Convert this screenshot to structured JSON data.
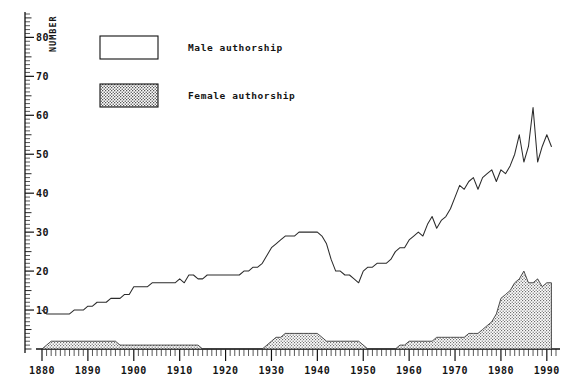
{
  "figure": {
    "caption": "The relative proportions of male and female authorship in the scientific literature",
    "y_axis_label": "NUMBER"
  },
  "legend": {
    "position": "top-left-inset",
    "items": [
      {
        "label": "Male authorship",
        "swatch": "white-box",
        "color": "#ffffff"
      },
      {
        "label": "Female authorship",
        "swatch": "dotted-box",
        "color": "#d9d9d9"
      }
    ]
  },
  "chart_data": {
    "type": "area",
    "title": "",
    "subtitle": "",
    "xlabel": "",
    "ylabel": "NUMBER",
    "xlim": [
      1880,
      1992
    ],
    "ylim": [
      0,
      86
    ],
    "grid": false,
    "x_ticks": [
      1880,
      1890,
      1900,
      1910,
      1920,
      1930,
      1940,
      1950,
      1960,
      1970,
      1980,
      1990
    ],
    "x_tick_labels": [
      "1880",
      "1890",
      "1900",
      "1910",
      "1920",
      "1930",
      "1940",
      "1950",
      "1960",
      "1970",
      "1980",
      "1990"
    ],
    "x_minor_tick_step": 1,
    "y_ticks": [
      10,
      20,
      30,
      40,
      50,
      60,
      70,
      80
    ],
    "y_tick_labels": [
      "10",
      "20",
      "30",
      "40",
      "50",
      "60",
      "70",
      "80"
    ],
    "y_minor_tick_step": 1,
    "legend_position": "upper left",
    "x": [
      1880,
      1881,
      1882,
      1883,
      1884,
      1885,
      1886,
      1887,
      1888,
      1889,
      1890,
      1891,
      1892,
      1893,
      1894,
      1895,
      1896,
      1897,
      1898,
      1899,
      1900,
      1901,
      1902,
      1903,
      1904,
      1905,
      1906,
      1907,
      1908,
      1909,
      1910,
      1911,
      1912,
      1913,
      1914,
      1915,
      1916,
      1917,
      1918,
      1919,
      1920,
      1921,
      1922,
      1923,
      1924,
      1925,
      1926,
      1927,
      1928,
      1929,
      1930,
      1931,
      1932,
      1933,
      1934,
      1935,
      1936,
      1937,
      1938,
      1939,
      1940,
      1941,
      1942,
      1943,
      1944,
      1945,
      1946,
      1947,
      1948,
      1949,
      1950,
      1951,
      1952,
      1953,
      1954,
      1955,
      1956,
      1957,
      1958,
      1959,
      1960,
      1961,
      1962,
      1963,
      1964,
      1965,
      1966,
      1967,
      1968,
      1969,
      1970,
      1971,
      1972,
      1973,
      1974,
      1975,
      1976,
      1977,
      1978,
      1979,
      1980,
      1981,
      1982,
      1983,
      1984,
      1985,
      1986,
      1987,
      1988,
      1989,
      1990,
      1991
    ],
    "series": [
      {
        "name": "Male authorship",
        "fill": "none",
        "values": [
          10,
          9,
          9,
          9,
          9,
          9,
          9,
          10,
          10,
          10,
          11,
          11,
          12,
          12,
          12,
          13,
          13,
          13,
          14,
          14,
          16,
          16,
          16,
          16,
          17,
          17,
          17,
          17,
          17,
          17,
          18,
          17,
          19,
          19,
          18,
          18,
          19,
          19,
          19,
          19,
          19,
          19,
          19,
          19,
          20,
          20,
          21,
          21,
          22,
          24,
          26,
          27,
          28,
          29,
          29,
          29,
          30,
          30,
          30,
          30,
          30,
          29,
          27,
          23,
          20,
          20,
          19,
          19,
          18,
          17,
          20,
          21,
          21,
          22,
          22,
          22,
          23,
          25,
          26,
          26,
          28,
          29,
          30,
          29,
          32,
          34,
          31,
          33,
          34,
          36,
          39,
          42,
          41,
          43,
          44,
          41,
          44,
          45,
          46,
          43,
          46,
          45,
          47,
          50,
          55,
          48,
          52,
          62,
          48,
          52,
          55,
          52
        ]
      },
      {
        "name": "Female authorship",
        "fill": "dotted",
        "values": [
          0,
          1,
          2,
          2,
          2,
          2,
          2,
          2,
          2,
          2,
          2,
          2,
          2,
          2,
          2,
          2,
          2,
          1,
          1,
          1,
          1,
          1,
          1,
          1,
          1,
          1,
          1,
          1,
          1,
          1,
          1,
          1,
          1,
          1,
          1,
          0,
          0,
          0,
          0,
          0,
          0,
          0,
          0,
          0,
          0,
          0,
          0,
          0,
          0,
          1,
          2,
          3,
          3,
          4,
          4,
          4,
          4,
          4,
          4,
          4,
          4,
          3,
          2,
          2,
          2,
          2,
          2,
          2,
          2,
          2,
          1,
          0,
          0,
          0,
          0,
          0,
          0,
          0,
          1,
          1,
          2,
          2,
          2,
          2,
          2,
          2,
          3,
          3,
          3,
          3,
          3,
          3,
          3,
          4,
          4,
          4,
          5,
          6,
          7,
          9,
          13,
          14,
          15,
          17,
          18,
          20,
          17,
          17,
          18,
          16,
          17,
          17
        ]
      }
    ]
  }
}
